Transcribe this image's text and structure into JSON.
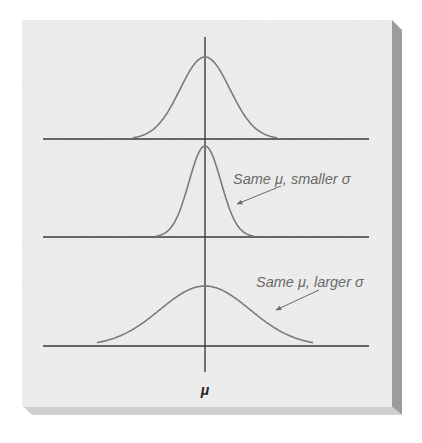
{
  "figure": {
    "colors": {
      "page_background": "#ffffff",
      "panel_background": "#eeeeee",
      "panel_shadow": "#9a9a9a",
      "axis": "#2e2e2e",
      "curve": "#7a7a7a",
      "label_text": "#6a6a6a",
      "mu_label": "#222222"
    },
    "panels": [
      {
        "name": "reference",
        "mu": 0,
        "sigma": 1.0,
        "label": ""
      },
      {
        "name": "smaller-sigma",
        "mu": 0,
        "sigma": 0.6,
        "label": "Same μ, smaller σ"
      },
      {
        "name": "larger-sigma",
        "mu": 0,
        "sigma": 1.8,
        "label": "Same μ, larger σ"
      }
    ],
    "labels": {
      "smaller": "Same μ, smaller σ",
      "larger": "Same μ, larger σ",
      "mu_axis": "μ"
    }
  }
}
